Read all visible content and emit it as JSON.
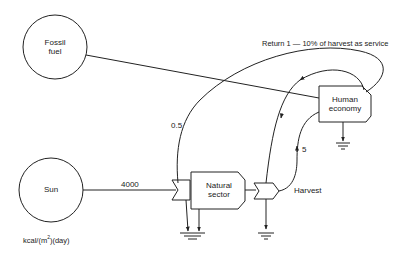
{
  "diagram": {
    "type": "energy-systems-flow-diagram",
    "sources": [
      {
        "id": "fossil",
        "label_line1": "Fossil",
        "label_line2": "fuel"
      },
      {
        "id": "sun",
        "label": "Sun"
      }
    ],
    "components": [
      {
        "id": "natural",
        "label_line1": "Natural",
        "label_line2": "sector"
      },
      {
        "id": "human",
        "label_line1": "Human",
        "label_line2": "economy"
      }
    ],
    "flows": [
      {
        "from": "sun",
        "to": "natural",
        "label": "4000"
      },
      {
        "from": "human",
        "to": "natural",
        "label": "0.5"
      },
      {
        "from": "harvest",
        "to": "human",
        "label": "5"
      }
    ],
    "labels": {
      "harvest": "Harvest",
      "return": "Return 1 — 10% of harvest as service",
      "units_prefix": "kcal/(m",
      "units_sup": "2",
      "units_suffix": ")(day)"
    },
    "colors": {
      "stroke": "#222222",
      "background": "#ffffff"
    }
  }
}
